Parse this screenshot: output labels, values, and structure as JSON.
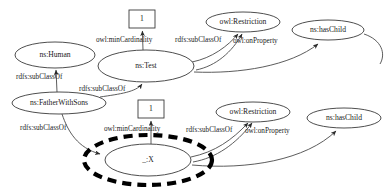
{
  "diagram": {
    "type": "rdf-graph",
    "width": 392,
    "height": 190,
    "background_color": "#ffffff",
    "stroke_color": "#3a3a3a",
    "text_color": "#1a1a1a",
    "highlight_color": "#000000"
  },
  "nodes": [
    {
      "id": "lit_one_top",
      "label": "1",
      "shape": "rect",
      "cx": 142,
      "cy": 19,
      "rx": 13,
      "ry": 9
    },
    {
      "id": "ns_human",
      "label": "ns:Human",
      "shape": "ellipse",
      "cx": 55,
      "cy": 55,
      "rx": 40,
      "ry": 13
    },
    {
      "id": "ns_test",
      "label": "ns:Test",
      "shape": "ellipse",
      "cx": 146,
      "cy": 66,
      "rx": 48,
      "ry": 16
    },
    {
      "id": "owl_restriction_top",
      "label": "owl:Restriction",
      "shape": "ellipse",
      "cx": 243,
      "cy": 22,
      "rx": 37,
      "ry": 10
    },
    {
      "id": "ns_haschild_top",
      "label": "ns:hasChild",
      "shape": "ellipse",
      "cx": 328,
      "cy": 30,
      "rx": 36,
      "ry": 10
    },
    {
      "id": "ns_fatherwithsons",
      "label": "ns:FatherWithSons",
      "shape": "ellipse",
      "cx": 59,
      "cy": 103,
      "rx": 47,
      "ry": 11
    },
    {
      "id": "lit_one_bottom",
      "label": "1",
      "shape": "rect",
      "cx": 151,
      "cy": 109,
      "rx": 13,
      "ry": 9
    },
    {
      "id": "owl_restriction_bottom",
      "label": "owl:Restriction",
      "shape": "ellipse",
      "cx": 253,
      "cy": 112,
      "rx": 37,
      "ry": 10
    },
    {
      "id": "ns_haschild_bottom",
      "label": "ns:hasChild",
      "shape": "ellipse",
      "cx": 344,
      "cy": 118,
      "rx": 37,
      "ry": 10
    },
    {
      "id": "blank_x",
      "label": "_:X",
      "shape": "ellipse",
      "cx": 148,
      "cy": 160,
      "rx": 43,
      "ry": 16
    },
    {
      "id": "blank_x_highlight",
      "label": "",
      "shape": "dashed-ellipse",
      "cx": 148,
      "cy": 160,
      "rx": 64,
      "ry": 25
    }
  ],
  "edges": [
    {
      "id": "e1",
      "from": "ns_test",
      "to": "lit_one_top",
      "label": "owl:minCardinality",
      "label_x": 96,
      "label_y": 40
    },
    {
      "id": "e2",
      "from": "ns_test",
      "to": "owl_restriction_top",
      "label": "rdfs:subClassOf",
      "label_x": 175,
      "label_y": 40
    },
    {
      "id": "e3",
      "from": "ns_test",
      "to": "owl_restriction_top",
      "label": "owl:onProperty",
      "label_x": 233,
      "label_y": 41
    },
    {
      "id": "e4",
      "from": "ns_test",
      "to": "ns_haschild_top",
      "label": "",
      "label_x": 0,
      "label_y": 0
    },
    {
      "id": "e5",
      "from": "ns_fatherwithsons",
      "to": "ns_human",
      "label": "rdfs:subClassOf",
      "label_x": 16,
      "label_y": 77
    },
    {
      "id": "e6",
      "from": "ns_fatherwithsons",
      "to": "ns_test",
      "label": "rdfs:subClassOf",
      "label_x": 79,
      "label_y": 89
    },
    {
      "id": "e7",
      "from": "blank_x",
      "to": "lit_one_bottom",
      "label": "owl:minCardinality",
      "label_x": 104,
      "label_y": 129
    },
    {
      "id": "e8",
      "from": "ns_fatherwithsons",
      "to": "blank_x",
      "label": "rdfs:subClassOf",
      "label_x": 20,
      "label_y": 128
    },
    {
      "id": "e9",
      "from": "blank_x",
      "to": "owl_restriction_bottom",
      "label": "rdfs:subClassOf",
      "label_x": 186,
      "label_y": 130
    },
    {
      "id": "e10",
      "from": "blank_x",
      "to": "owl_restriction_bottom",
      "label": "owl:onProperty",
      "label_x": 245,
      "label_y": 131
    },
    {
      "id": "e11",
      "from": "blank_x",
      "to": "ns_haschild_bottom",
      "label": "",
      "label_x": 0,
      "label_y": 0
    }
  ]
}
